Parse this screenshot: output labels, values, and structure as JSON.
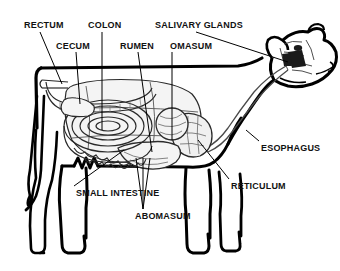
{
  "figure": {
    "style": "black-and-white-line-drawing",
    "line_color": "#000000",
    "background_color": "#ffffff",
    "fill_color": "#f2f2f2"
  },
  "labels": [
    {
      "id": "rectum",
      "text": "RECTUM",
      "x": 24,
      "y": 20,
      "leader_to_x": 62,
      "leader_to_y": 84
    },
    {
      "id": "colon",
      "text": "COLON",
      "x": 88,
      "y": 20,
      "leader_to_x": 102,
      "leader_to_y": 130
    },
    {
      "id": "salivary-glands",
      "text": "SALIVARY GLANDS",
      "x": 155,
      "y": 20,
      "leader_to_x": 278,
      "leader_to_y": 65
    },
    {
      "id": "cecum",
      "text": "CECUM",
      "x": 56,
      "y": 41,
      "leader_to_x": 80,
      "leader_to_y": 104
    },
    {
      "id": "rumen",
      "text": "RUMEN",
      "x": 120,
      "y": 41,
      "leader_to_x": 152,
      "leader_to_y": 152
    },
    {
      "id": "omasum",
      "text": "OMASUM",
      "x": 170,
      "y": 41,
      "leader_to_x": 172,
      "leader_to_y": 140
    },
    {
      "id": "esophagus",
      "text": "ESOPHAGUS",
      "x": 261,
      "y": 143,
      "leader_to_x": 246,
      "leader_to_y": 132
    },
    {
      "id": "reticulum",
      "text": "RETICULUM",
      "x": 231,
      "y": 181,
      "leader_to_x": 196,
      "leader_to_y": 140
    },
    {
      "id": "small-intestine",
      "text": "SMALL INTESTINE",
      "x": 76,
      "y": 188,
      "leader_to_x": 124,
      "leader_to_y": 150
    },
    {
      "id": "abomasum",
      "text": "ABOMASUM",
      "x": 135,
      "y": 211,
      "leader_to_x": 143,
      "leader_to_y": 160
    }
  ],
  "organs": [
    {
      "id": "rectum",
      "name": "Rectum"
    },
    {
      "id": "colon",
      "name": "Colon"
    },
    {
      "id": "cecum",
      "name": "Cecum"
    },
    {
      "id": "rumen",
      "name": "Rumen"
    },
    {
      "id": "omasum",
      "name": "Omasum"
    },
    {
      "id": "abomasum",
      "name": "Abomasum"
    },
    {
      "id": "reticulum",
      "name": "Reticulum"
    },
    {
      "id": "esophagus",
      "name": "Esophagus"
    },
    {
      "id": "salivary-glands",
      "name": "Salivary glands"
    },
    {
      "id": "small-intestine",
      "name": "Small intestine"
    }
  ]
}
